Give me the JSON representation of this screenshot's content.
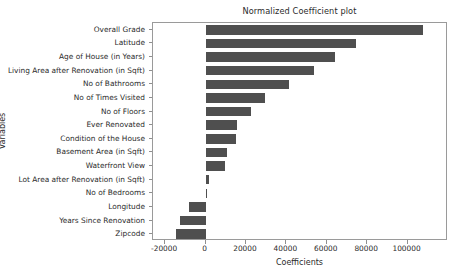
{
  "chart_data": {
    "type": "bar",
    "orientation": "horizontal",
    "title": "Normalized Coefficient plot",
    "xlabel": "Coefficients",
    "ylabel": "Variables",
    "categories": [
      "Overall Grade",
      "Latitude",
      "Age of House (in Years)",
      "Living Area after Renovation (in Sqft)",
      "No of Bathrooms",
      "No of Times Visited",
      "No of Floors",
      "Ever Renovated",
      "Condition of the House",
      "Basement Area (in Sqft)",
      "Waterfront View",
      "Lot Area after Renovation (in Sqft)",
      "No of Bedrooms",
      "Longitude",
      "Years Since Renovation",
      "Zipcode"
    ],
    "values": [
      107500,
      74500,
      64000,
      53500,
      41500,
      29500,
      22500,
      15500,
      15000,
      10500,
      9500,
      1500,
      900,
      -8000,
      -12500,
      -14500
    ],
    "xticks": [
      -20000,
      0,
      20000,
      40000,
      60000,
      80000,
      100000
    ],
    "xticklabels": [
      "-20000",
      "0",
      "20000",
      "40000",
      "60000",
      "80000",
      "100000"
    ],
    "xlim": [
      -26000,
      120000
    ],
    "grid": false,
    "legend": false,
    "bar_color": "#4f4f4f",
    "axes_color": "#9a9a9a",
    "background_color": "#ffffff"
  }
}
